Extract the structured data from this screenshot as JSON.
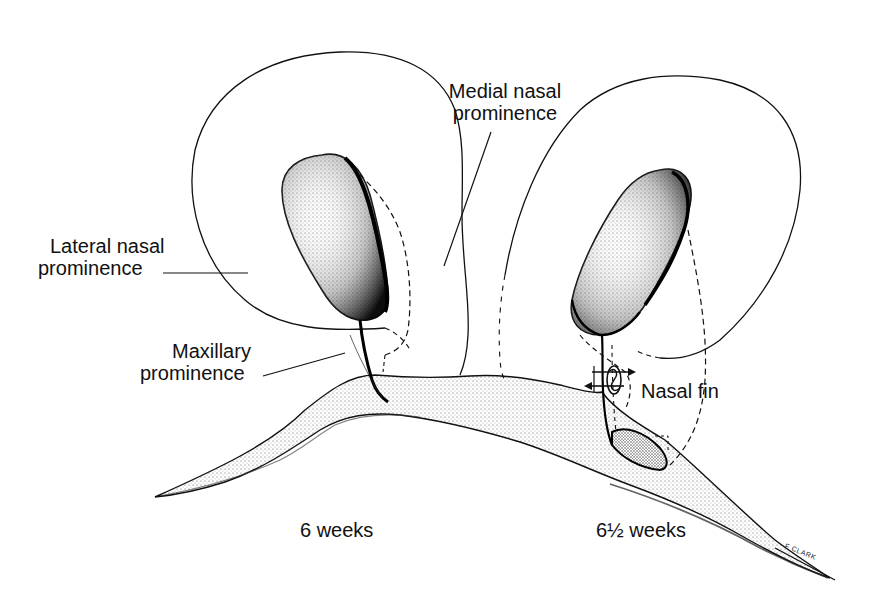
{
  "figure": {
    "ink_color": "#111111",
    "stipple_color": "#555555",
    "background": "#ffffff"
  },
  "labels": {
    "medial_nasal": {
      "line1": "Medial nasal",
      "line2": "prominence"
    },
    "lateral_nasal": {
      "line1": "Lateral nasal",
      "line2": "prominence"
    },
    "maxillary": {
      "line1": "Maxillary",
      "line2": "prominence"
    },
    "nasal_fin": "Nasal fin",
    "stage_left": "6 weeks",
    "stage_right": "6½ weeks",
    "artist_signature": "F CLARK"
  }
}
